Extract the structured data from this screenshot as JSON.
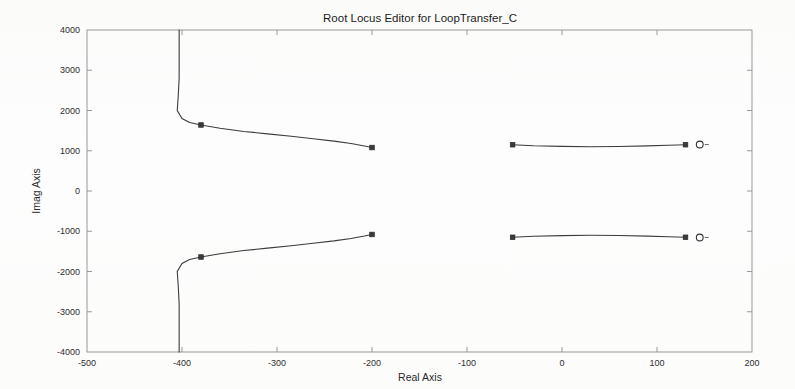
{
  "chart_data": {
    "type": "line",
    "title": "Root Locus Editor for LoopTransfer_C",
    "xlabel": "Real Axis",
    "ylabel": "Imag Axis",
    "xlim": [
      -500,
      200
    ],
    "ylim": [
      -4000,
      4000
    ],
    "xticks": [
      -500,
      -400,
      -300,
      -200,
      -100,
      0,
      100,
      200
    ],
    "xtick_labels": [
      "-500",
      "-400",
      "-300",
      "-200",
      "-100",
      "0",
      "100",
      "200"
    ],
    "yticks": [
      -4000,
      -3000,
      -2000,
      -1000,
      0,
      1000,
      2000,
      3000,
      4000
    ],
    "ytick_labels": [
      "-4000",
      "-3000",
      "-2000",
      "-1000",
      "0",
      "1000",
      "2000",
      "3000",
      "4000"
    ],
    "grid": false,
    "legend": null,
    "series": [
      {
        "name": "locus-branch-upper-left",
        "comment": "Near-vertical asymptote around Real = -403 rising off the top of the axes, bending right near Imag = 1700 and sweeping to about (-200, 1080).",
        "points": [
          [
            -403,
            4000
          ],
          [
            -403,
            3400
          ],
          [
            -403,
            2800
          ],
          [
            -404,
            2350
          ],
          [
            -405,
            2000
          ],
          [
            -400,
            1800
          ],
          [
            -392,
            1700
          ],
          [
            -380,
            1640
          ],
          [
            -360,
            1560
          ],
          [
            -335,
            1480
          ],
          [
            -310,
            1420
          ],
          [
            -285,
            1360
          ],
          [
            -262,
            1300
          ],
          [
            -240,
            1240
          ],
          [
            -222,
            1180
          ],
          [
            -208,
            1120
          ],
          [
            -200,
            1080
          ]
        ]
      },
      {
        "name": "locus-branch-lower-left",
        "comment": "Mirror image of the upper-left branch below the real axis.",
        "points": [
          [
            -403,
            -4000
          ],
          [
            -403,
            -3400
          ],
          [
            -403,
            -2800
          ],
          [
            -404,
            -2350
          ],
          [
            -405,
            -2000
          ],
          [
            -400,
            -1800
          ],
          [
            -392,
            -1700
          ],
          [
            -380,
            -1640
          ],
          [
            -360,
            -1560
          ],
          [
            -335,
            -1480
          ],
          [
            -310,
            -1420
          ],
          [
            -285,
            -1360
          ],
          [
            -262,
            -1300
          ],
          [
            -240,
            -1240
          ],
          [
            -222,
            -1180
          ],
          [
            -208,
            -1120
          ],
          [
            -200,
            -1080
          ]
        ]
      },
      {
        "name": "locus-branch-upper-right",
        "comment": "Shallow branch from about (-52, 1150) dipping slightly and returning to (130, 1150) near the zero.",
        "points": [
          [
            -52,
            1150
          ],
          [
            -30,
            1125
          ],
          [
            0,
            1108
          ],
          [
            30,
            1100
          ],
          [
            60,
            1105
          ],
          [
            90,
            1120
          ],
          [
            112,
            1135
          ],
          [
            130,
            1150
          ]
        ]
      },
      {
        "name": "locus-branch-lower-right",
        "comment": "Mirror image of the upper-right branch below the real axis.",
        "points": [
          [
            -52,
            -1150
          ],
          [
            -30,
            -1125
          ],
          [
            0,
            -1108
          ],
          [
            30,
            -1100
          ],
          [
            60,
            -1105
          ],
          [
            90,
            -1120
          ],
          [
            112,
            -1135
          ],
          [
            130,
            -1150
          ]
        ]
      }
    ],
    "markers": [
      {
        "name": "gain-marker-upper-left-branch",
        "shape": "square-filled",
        "x": -380,
        "y": 1640
      },
      {
        "name": "closed-loop-pole-upper-left-end",
        "shape": "square-filled",
        "x": -200,
        "y": 1080
      },
      {
        "name": "gain-marker-lower-left-branch",
        "shape": "square-filled",
        "x": -380,
        "y": -1640
      },
      {
        "name": "closed-loop-pole-lower-left-end",
        "shape": "square-filled",
        "x": -200,
        "y": -1080
      },
      {
        "name": "open-loop-pole-upper-right",
        "shape": "square-filled",
        "x": -52,
        "y": 1150
      },
      {
        "name": "closed-loop-pole-upper-right",
        "shape": "square-filled",
        "x": 130,
        "y": 1150
      },
      {
        "name": "open-loop-pole-lower-right",
        "shape": "square-filled",
        "x": -52,
        "y": -1150
      },
      {
        "name": "closed-loop-pole-lower-right",
        "shape": "square-filled",
        "x": 130,
        "y": -1150
      },
      {
        "name": "zero-marker-upper-right",
        "shape": "circle-open",
        "x": 145,
        "y": 1155
      },
      {
        "name": "zero-marker-lower-right",
        "shape": "circle-open",
        "x": 145,
        "y": -1155
      }
    ]
  },
  "colors": {
    "background": "#fdfdfc",
    "frame": "#8f8f8f",
    "locus": "#3c3c3c",
    "text": "#2a2a2a"
  }
}
